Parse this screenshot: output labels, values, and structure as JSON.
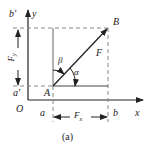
{
  "figure": {
    "caption": "(a)",
    "axes": {
      "x_label": "x",
      "y_label": "y",
      "origin_label": "O"
    },
    "points": {
      "A": "A",
      "B": "B"
    },
    "projections": {
      "x_start": "a",
      "x_end": "b",
      "y_start": "a'",
      "y_end": "b'"
    },
    "force": {
      "label": "F"
    },
    "components": {
      "fx": "F",
      "fx_sub": "x",
      "fy": "F",
      "fy_sub": "y"
    },
    "angles": {
      "alpha": "α",
      "beta": "β"
    },
    "colors": {
      "line": "#222222",
      "dashed": "#888888",
      "background": "#ffffff"
    }
  }
}
